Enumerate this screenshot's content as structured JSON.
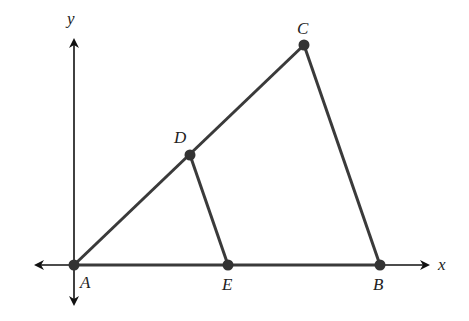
{
  "diagram": {
    "axes": {
      "x_label": "x",
      "y_label": "y",
      "origin": [
        74,
        265
      ],
      "x_axis": {
        "from": [
          34,
          265
        ],
        "to": [
          430,
          265
        ]
      },
      "y_axis": {
        "from": [
          74,
          306
        ],
        "to": [
          74,
          38
        ]
      }
    },
    "points": [
      {
        "id": "A",
        "label": "A",
        "pos": [
          74,
          265
        ],
        "label_pos": [
          80,
          274
        ]
      },
      {
        "id": "B",
        "label": "B",
        "pos": [
          380,
          265
        ],
        "label_pos": [
          373,
          275
        ]
      },
      {
        "id": "C",
        "label": "C",
        "pos": [
          304,
          45
        ],
        "label_pos": [
          297,
          20
        ]
      },
      {
        "id": "D",
        "label": "D",
        "pos": [
          190,
          155
        ],
        "label_pos": [
          174,
          129
        ]
      },
      {
        "id": "E",
        "label": "E",
        "pos": [
          228,
          265
        ],
        "label_pos": [
          222,
          275
        ]
      }
    ],
    "segments": [
      {
        "from": "A",
        "to": "C"
      },
      {
        "from": "C",
        "to": "B"
      },
      {
        "from": "D",
        "to": "E"
      },
      {
        "from": "A",
        "to": "B"
      }
    ],
    "colors": {
      "line": "#3a3a3a",
      "axis": "#111111",
      "point": "#333333"
    }
  }
}
